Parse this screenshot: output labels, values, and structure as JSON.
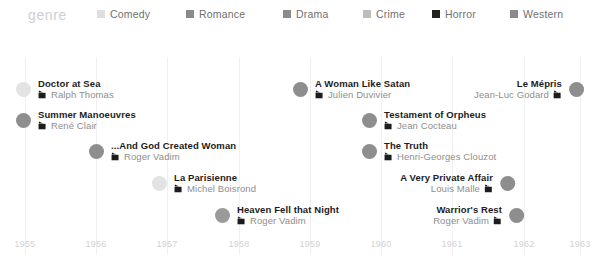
{
  "legend": {
    "title": "genre",
    "items": [
      {
        "label": "Comedy",
        "color": "#dedede",
        "x": 97
      },
      {
        "label": "Romance",
        "color": "#8a8a8a",
        "x": 186
      },
      {
        "label": "Drama",
        "color": "#8a8a8a",
        "x": 283
      },
      {
        "label": "Crime",
        "color": "#bcbcbc",
        "x": 363
      },
      {
        "label": "Horror",
        "color": "#222222",
        "x": 432
      },
      {
        "label": "Western",
        "color": "#8a8a8a",
        "x": 510
      }
    ]
  },
  "axis": {
    "label": "",
    "ticks": [
      {
        "label": "1955",
        "x": 25
      },
      {
        "label": "1956",
        "x": 96
      },
      {
        "label": "1957",
        "x": 167
      },
      {
        "label": "1958",
        "x": 239
      },
      {
        "label": "1959",
        "x": 310
      },
      {
        "label": "1960",
        "x": 381
      },
      {
        "label": "1961",
        "x": 452
      },
      {
        "label": "1962",
        "x": 524
      },
      {
        "label": "1963",
        "x": 580
      }
    ]
  },
  "icons": {
    "film": "clapperboard-icon"
  },
  "chart_data": {
    "type": "timeline",
    "title": "",
    "xlabel": "",
    "ylabel": "",
    "xlim": [
      1955,
      1963
    ],
    "grid": true,
    "legend_position": "top",
    "legend_title": "genre",
    "categories": [
      "Comedy",
      "Romance",
      "Drama",
      "Crime",
      "Horror",
      "Western"
    ],
    "events": [
      {
        "title": "Doctor at Sea",
        "director": "Ralph Thomas",
        "genre": "Comedy",
        "color": "#e3e3e3",
        "align": "left",
        "dot_x": 23,
        "row_y": 54
      },
      {
        "title": "Summer Manoeuvres",
        "director": "René Clair",
        "genre": "Romance",
        "color": "#8e8e8e",
        "align": "left",
        "dot_x": 23,
        "row_y": 85
      },
      {
        "title": "...And God Created Woman",
        "director": "Roger Vadim",
        "genre": "Romance",
        "color": "#8e8e8e",
        "align": "left",
        "dot_x": 96,
        "row_y": 116
      },
      {
        "title": "La Parisienne",
        "director": "Michel Boisrond",
        "genre": "Comedy",
        "color": "#e3e3e3",
        "align": "left",
        "dot_x": 159,
        "row_y": 148
      },
      {
        "title": "Heaven Fell that Night",
        "director": "Roger Vadim",
        "genre": "Drama",
        "color": "#9a9a9a",
        "align": "left",
        "dot_x": 222,
        "row_y": 180
      },
      {
        "title": "A Woman Like Satan",
        "director": "Julien Duvivier",
        "genre": "Drama",
        "color": "#8e8e8e",
        "align": "left",
        "dot_x": 300,
        "row_y": 54
      },
      {
        "title": "Testament of Orpheus",
        "director": "Jean Cocteau",
        "genre": "Drama",
        "color": "#8e8e8e",
        "align": "left",
        "dot_x": 369,
        "row_y": 85
      },
      {
        "title": "The Truth",
        "director": "Henri-Georges Clouzot",
        "genre": "Crime",
        "color": "#8e8e8e",
        "align": "left",
        "dot_x": 369,
        "row_y": 116
      },
      {
        "title": "A Very Private Affair",
        "director": "Louis Malle",
        "genre": "Drama",
        "color": "#8e8e8e",
        "align": "right",
        "dot_x": 507,
        "row_y": 148
      },
      {
        "title": "Warrior's Rest",
        "director": "Roger Vadim",
        "genre": "Drama",
        "color": "#8e8e8e",
        "align": "right",
        "dot_x": 516,
        "row_y": 180
      },
      {
        "title": "Le Mépris",
        "director": "Jean-Luc Godard",
        "genre": "Drama",
        "color": "#8e8e8e",
        "align": "right",
        "dot_x": 576,
        "row_y": 54
      }
    ]
  }
}
